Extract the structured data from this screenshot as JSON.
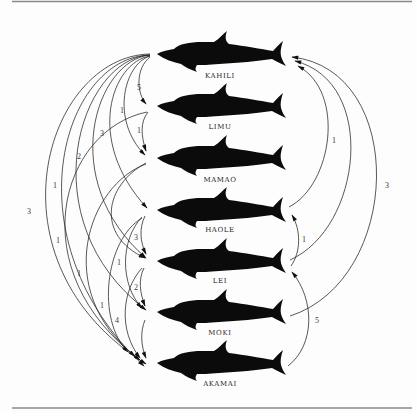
{
  "figure": {
    "nodes": [
      {
        "id": "kahili",
        "name": "KAHILI"
      },
      {
        "id": "limu",
        "name": "LIMU"
      },
      {
        "id": "mamao",
        "name": "MAMAO"
      },
      {
        "id": "haole",
        "name": "HAOLE"
      },
      {
        "id": "lei",
        "name": "LEI"
      },
      {
        "id": "moki",
        "name": "MOKI"
      },
      {
        "id": "akamai",
        "name": "AKAMAI"
      }
    ],
    "edges": [
      {
        "from": "KAHILI",
        "to": "LIMU",
        "side": "left",
        "label": "5"
      },
      {
        "from": "KAHILI",
        "to": "MAMAO",
        "side": "left",
        "label": "1"
      },
      {
        "from": "LIMU",
        "to": "MAMAO",
        "side": "left",
        "label": "1"
      },
      {
        "from": "KAHILI",
        "to": "HAOLE",
        "side": "left",
        "label": "3"
      },
      {
        "from": "KAHILI",
        "to": "LEI",
        "side": "left",
        "label": "2"
      },
      {
        "from": "KAHILI",
        "to": "MOKI",
        "side": "left",
        "label": "1"
      },
      {
        "from": "KAHILI",
        "to": "AKAMAI",
        "side": "left",
        "label": "3"
      },
      {
        "from": "LIMU",
        "to": "AKAMAI",
        "side": "left",
        "label": "1"
      },
      {
        "from": "MAMAO",
        "to": "LEI",
        "side": "left",
        "label": ""
      },
      {
        "from": "MAMAO",
        "to": "AKAMAI",
        "side": "left",
        "label": "1"
      },
      {
        "from": "HAOLE",
        "to": "LEI",
        "side": "left",
        "label": "3"
      },
      {
        "from": "HAOLE",
        "to": "MOKI",
        "side": "left",
        "label": "1"
      },
      {
        "from": "HAOLE",
        "to": "AKAMAI",
        "side": "left",
        "label": "1"
      },
      {
        "from": "LEI",
        "to": "MOKI",
        "side": "left",
        "label": "2"
      },
      {
        "from": "LEI",
        "to": "AKAMAI",
        "side": "left",
        "label": "4"
      },
      {
        "from": "MOKI",
        "to": "AKAMAI",
        "side": "left",
        "label": ""
      },
      {
        "from": "KAHILI",
        "to": "AKAMAI",
        "side": "left",
        "label": ""
      },
      {
        "from": "HAOLE",
        "to": "KAHILI",
        "side": "right",
        "label": "1"
      },
      {
        "from": "LEI",
        "to": "KAHILI",
        "side": "right",
        "label": ""
      },
      {
        "from": "MOKI",
        "to": "KAHILI",
        "side": "right",
        "label": "3"
      },
      {
        "from": "LEI",
        "to": "HAOLE",
        "side": "right",
        "label": "1"
      },
      {
        "from": "AKAMAI",
        "to": "LEI",
        "side": "right",
        "label": "5"
      }
    ]
  }
}
